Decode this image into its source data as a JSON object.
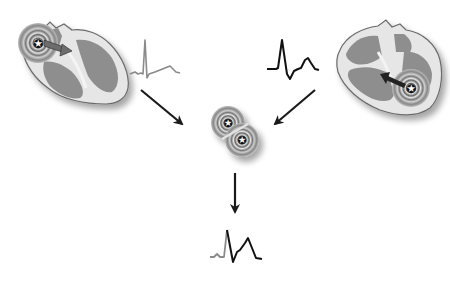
{
  "diagram": {
    "colors": {
      "background": "#ffffff",
      "heart_outline": "#6a6a6a",
      "heart_wall": "#e4e4e4",
      "chamber": "#8e8e8e",
      "arrow": "#1a1a1a",
      "ecg_sinus": "#8a8a8a",
      "ecg_ectopic": "#111111"
    },
    "nodes": [
      {
        "id": "left-heart",
        "label": "Sinus origin (atrial focus)",
        "ecg": "narrow-qrs"
      },
      {
        "id": "right-heart",
        "label": "Ventricular ectopic focus",
        "ecg": "wide-qrs"
      },
      {
        "id": "fusion",
        "label": "Colliding wavefronts"
      },
      {
        "id": "fusion-ecg",
        "label": "Fusion complex"
      }
    ],
    "edges": [
      {
        "from": "left-heart",
        "to": "fusion"
      },
      {
        "from": "right-heart",
        "to": "fusion"
      },
      {
        "from": "fusion",
        "to": "fusion-ecg"
      }
    ]
  }
}
